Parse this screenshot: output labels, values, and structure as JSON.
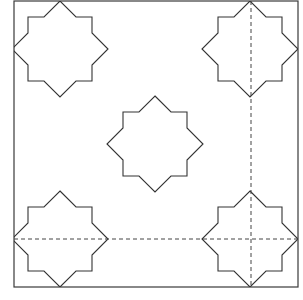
{
  "diagram": {
    "type": "geometric-tiling-pattern",
    "colors": {
      "line": "#333333",
      "background": "#ffffff"
    },
    "frame": {
      "x1": 14,
      "y1": 1,
      "x2": 298,
      "y2": 287
    },
    "star_radius": 48,
    "star_centers": [
      [
        60,
        49
      ],
      [
        250,
        49
      ],
      [
        155,
        144
      ],
      [
        60,
        239
      ],
      [
        250,
        239
      ]
    ],
    "star_shape": [
      [
        0,
        -48
      ],
      [
        16,
        -32
      ],
      [
        32,
        -32
      ],
      [
        32,
        -16
      ],
      [
        48,
        0
      ],
      [
        32,
        16
      ],
      [
        32,
        32
      ],
      [
        16,
        32
      ],
      [
        0,
        48
      ],
      [
        -16,
        32
      ],
      [
        -32,
        32
      ],
      [
        -32,
        16
      ],
      [
        -48,
        0
      ],
      [
        -32,
        -16
      ],
      [
        -32,
        -32
      ],
      [
        -16,
        -32
      ]
    ],
    "guides": [
      {
        "orientation": "vertical",
        "x": 251,
        "y1": 1,
        "y2": 287,
        "style": "dashed"
      },
      {
        "orientation": "horizontal",
        "y": 239,
        "x1": 14,
        "x2": 298,
        "style": "dashed"
      }
    ]
  }
}
